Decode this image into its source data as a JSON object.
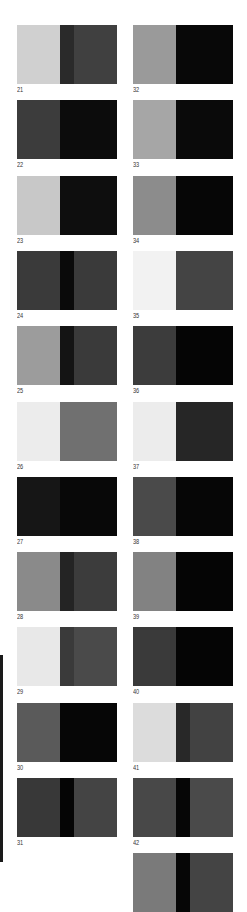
{
  "swatches": [
    {
      "label": "21",
      "col": 0,
      "row": 0,
      "a": "#d0d0d0",
      "s": "#2a2a2a",
      "b": "#404040"
    },
    {
      "label": "22",
      "col": 0,
      "row": 1,
      "a": "#3c3c3c",
      "s": null,
      "b": "#0c0c0c"
    },
    {
      "label": "23",
      "col": 0,
      "row": 2,
      "a": "#c8c8c8",
      "s": null,
      "b": "#0e0e0e"
    },
    {
      "label": "24",
      "col": 0,
      "row": 3,
      "a": "#3a3a3a",
      "s": "#0a0a0a",
      "b": "#3a3a3a"
    },
    {
      "label": "25",
      "col": 0,
      "row": 4,
      "a": "#9c9c9c",
      "s": "#141414",
      "b": "#3a3a3a"
    },
    {
      "label": "26",
      "col": 0,
      "row": 5,
      "a": "#ececec",
      "s": null,
      "b": "#707070"
    },
    {
      "label": "27",
      "col": 0,
      "row": 6,
      "a": "#161616",
      "s": null,
      "b": "#080808"
    },
    {
      "label": "28",
      "col": 0,
      "row": 7,
      "a": "#8a8a8a",
      "s": "#242424",
      "b": "#3c3c3c"
    },
    {
      "label": "29",
      "col": 0,
      "row": 8,
      "a": "#e8e8e8",
      "s": "#3a3a3a",
      "b": "#4a4a4a"
    },
    {
      "label": "30",
      "col": 0,
      "row": 9,
      "a": "#5a5a5a",
      "s": null,
      "b": "#060606"
    },
    {
      "label": "31",
      "col": 0,
      "row": 10,
      "a": "#383838",
      "s": "#050505",
      "b": "#444444"
    },
    {
      "label": "32",
      "col": 1,
      "row": 0,
      "a": "#9a9a9a",
      "s": null,
      "b": "#080808"
    },
    {
      "label": "33",
      "col": 1,
      "row": 1,
      "a": "#a6a6a6",
      "s": null,
      "b": "#0a0a0a"
    },
    {
      "label": "34",
      "col": 1,
      "row": 2,
      "a": "#8c8c8c",
      "s": null,
      "b": "#060606"
    },
    {
      "label": "35",
      "col": 1,
      "row": 3,
      "a": "#f2f2f2",
      "s": null,
      "b": "#444444"
    },
    {
      "label": "36",
      "col": 1,
      "row": 4,
      "a": "#3c3c3c",
      "s": null,
      "b": "#050505"
    },
    {
      "label": "37",
      "col": 1,
      "row": 5,
      "a": "#ececec",
      "s": null,
      "b": "#262626"
    },
    {
      "label": "38",
      "col": 1,
      "row": 6,
      "a": "#4a4a4a",
      "s": null,
      "b": "#060606"
    },
    {
      "label": "39",
      "col": 1,
      "row": 7,
      "a": "#828282",
      "s": null,
      "b": "#050505"
    },
    {
      "label": "40",
      "col": 1,
      "row": 8,
      "a": "#3a3a3a",
      "s": null,
      "b": "#050505"
    },
    {
      "label": "41",
      "col": 1,
      "row": 9,
      "a": "#dcdcdc",
      "s": "#282828",
      "b": "#424242"
    },
    {
      "label": "42",
      "col": 1,
      "row": 10,
      "a": "#484848",
      "s": "#060606",
      "b": "#4a4a4a"
    },
    {
      "label": "",
      "col": 1,
      "row": 11,
      "a": "#7a7a7a",
      "s": "#060606",
      "b": "#444444"
    }
  ]
}
